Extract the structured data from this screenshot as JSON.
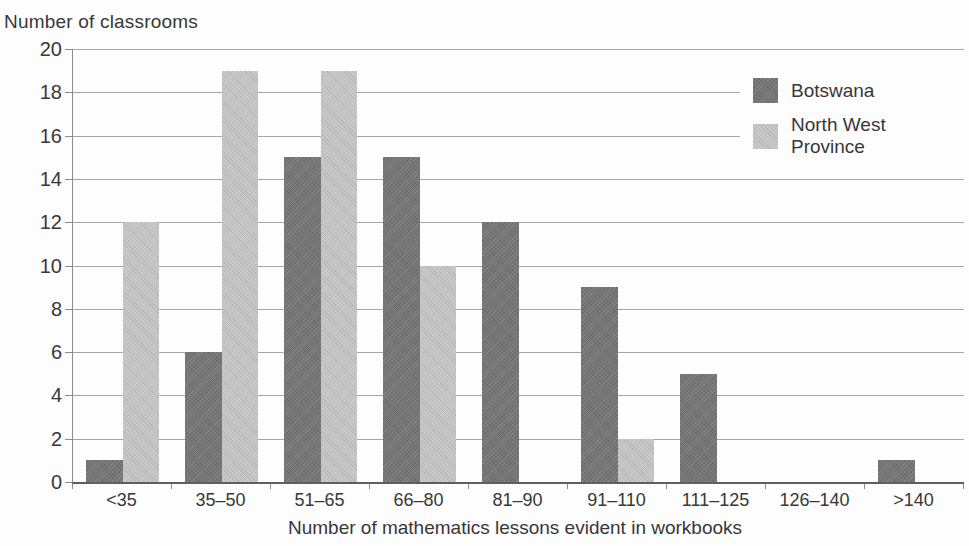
{
  "title": "Number of classrooms",
  "chart_data": {
    "type": "bar",
    "title": "",
    "categories": [
      "<35",
      "35–50",
      "51–65",
      "66–80",
      "81–90",
      "91–110",
      "111–125",
      "126–140",
      ">140"
    ],
    "series": [
      {
        "name": "Botswana",
        "color": "#757575",
        "values": [
          1,
          6,
          15,
          15,
          12,
          9,
          5,
          0,
          1
        ]
      },
      {
        "name": "North West Province",
        "color": "#c6c6c6",
        "values": [
          12,
          19,
          19,
          10,
          0,
          2,
          0,
          0,
          0
        ]
      }
    ],
    "xlabel": "Number of mathematics lessons evident in workbooks",
    "ylabel": "Number of classrooms",
    "ylim": [
      0,
      20
    ],
    "yticks": [
      0,
      2,
      4,
      6,
      8,
      10,
      12,
      14,
      16,
      18,
      20
    ],
    "grid": true,
    "legend_position": "top-right-inside",
    "axis_color": "#8c8c8c",
    "grid_color": "#a6a6a6",
    "text_color": "#383838"
  }
}
